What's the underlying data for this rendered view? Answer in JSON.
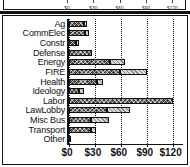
{
  "chart_data": {
    "type": "bar",
    "orientation": "horizontal",
    "stacked": true,
    "title": "",
    "subtitle": "",
    "xlabel": "",
    "ylabel": "",
    "xlim": [
      0,
      132
    ],
    "xticks": [
      0,
      30,
      60,
      90,
      120
    ],
    "xticklabels": [
      "$0",
      "$30",
      "$60",
      "$90",
      "$120"
    ],
    "grid": true,
    "legend": "none",
    "categories": [
      "Ag",
      "CommElec",
      "Constr",
      "Defense",
      "Energy",
      "FIRE",
      "Health",
      "Ideology",
      "Labor",
      "LawLobby",
      "Misc Bus",
      "Transport",
      "Other"
    ],
    "series": [
      {
        "name": "segment-a",
        "pattern": "dark-crosshatch",
        "color": "#3a3a3a",
        "values": [
          17,
          19,
          8,
          27,
          47,
          59,
          32,
          11,
          120,
          44,
          26,
          26,
          2
        ]
      },
      {
        "name": "segment-b",
        "pattern": "light-dotted",
        "color": "#d8d8d8",
        "values": [
          4,
          4,
          4,
          0,
          18,
          31,
          7,
          6,
          0,
          27,
          20,
          5,
          0
        ]
      }
    ],
    "totals": [
      21,
      23,
      12,
      27,
      65,
      90,
      39,
      17,
      120,
      71,
      46,
      31,
      2
    ]
  },
  "top_partial_chart": {
    "visible": true,
    "xticklabels": [
      "$0",
      "$30",
      "$60",
      "$90",
      "$120"
    ],
    "note": "bottom edge of a preceding chart, clipped by screenshot"
  }
}
